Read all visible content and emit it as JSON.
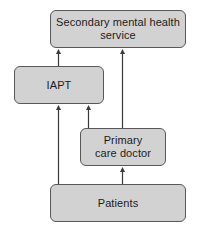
{
  "diagram": {
    "type": "flowchart",
    "background_color": "#ffffff",
    "node_fill_color": "#d2d2d2",
    "node_border_color": "#58585a",
    "arrow_color": "#3b3b3b",
    "nodes": [
      {
        "id": "secondary",
        "label": "Secondary mental health\nservice"
      },
      {
        "id": "iapt",
        "label": "IAPT"
      },
      {
        "id": "primary",
        "label": "Primary\ncare doctor"
      },
      {
        "id": "patients",
        "label": "Patients"
      }
    ],
    "edges": [
      {
        "from": "iapt",
        "to": "secondary",
        "direction": "up"
      },
      {
        "from": "primary",
        "to": "secondary",
        "direction": "up"
      },
      {
        "from": "primary",
        "to": "iapt",
        "direction": "up"
      },
      {
        "from": "patients",
        "to": "iapt",
        "direction": "up"
      },
      {
        "from": "patients",
        "to": "primary",
        "direction": "up"
      }
    ]
  }
}
